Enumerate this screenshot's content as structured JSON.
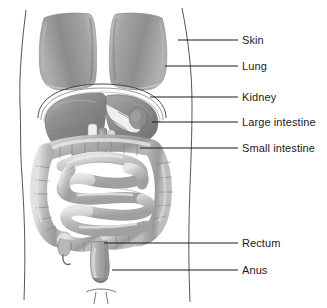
{
  "figure": {
    "background_color": "#ffffff",
    "line_color": "#1a1a1a",
    "colors": {
      "outline": "#4a4a4a",
      "lung_light": "#c2c2c2",
      "lung_mid": "#9e9e9e",
      "lung_dark": "#7d7d7d",
      "liver_light": "#a8a8a8",
      "liver_mid": "#8a8a8a",
      "liver_dark": "#6e6e6e",
      "colon_light": "#d6d6d6",
      "colon_mid": "#adadad",
      "colon_dark": "#8c8c8c",
      "small_intestine_light": "#dcdcdc",
      "small_intestine_mid": "#b4b4b4",
      "small_intestine_dark": "#949494",
      "rectum": "#b0b0b0",
      "diaphragm": "#f2f2f2"
    }
  },
  "labels": [
    {
      "id": "skin",
      "text": "Skin",
      "text_x": 242,
      "text_y": 35,
      "line_y": 40,
      "line_x1": 178,
      "line_x2": 238
    },
    {
      "id": "lung",
      "text": "Lung",
      "text_x": 242,
      "text_y": 61,
      "line_y": 66,
      "line_x1": 165,
      "line_x2": 238
    },
    {
      "id": "kidney",
      "text": "Kidney",
      "text_x": 242,
      "text_y": 92,
      "line_y": 97,
      "line_x1": 150,
      "line_x2": 238
    },
    {
      "id": "large-intestine",
      "text": "Large intestine",
      "text_x": 242,
      "text_y": 117,
      "line_y": 122,
      "line_x1": 152,
      "line_x2": 238
    },
    {
      "id": "small-intestine",
      "text": "Small intestine",
      "text_x": 242,
      "text_y": 143,
      "line_y": 148,
      "line_x1": 140,
      "line_x2": 238
    },
    {
      "id": "rectum",
      "text": "Rectum",
      "text_x": 242,
      "text_y": 238,
      "line_y": 243,
      "line_x1": 104,
      "line_x2": 238
    },
    {
      "id": "anus",
      "text": "Anus",
      "text_x": 242,
      "text_y": 265,
      "line_y": 270,
      "line_x1": 112,
      "line_x2": 238
    }
  ],
  "organs": [
    {
      "id": "body-outline",
      "name": "Skin / body outline"
    },
    {
      "id": "lung-left",
      "name": "Left lung"
    },
    {
      "id": "lung-right",
      "name": "Right lung"
    },
    {
      "id": "diaphragm",
      "name": "Diaphragm"
    },
    {
      "id": "liver",
      "name": "Liver"
    },
    {
      "id": "stomach",
      "name": "Stomach"
    },
    {
      "id": "large-intestine",
      "name": "Large intestine"
    },
    {
      "id": "small-intestine",
      "name": "Small intestine"
    },
    {
      "id": "rectum",
      "name": "Rectum"
    },
    {
      "id": "anus",
      "name": "Anus"
    }
  ]
}
